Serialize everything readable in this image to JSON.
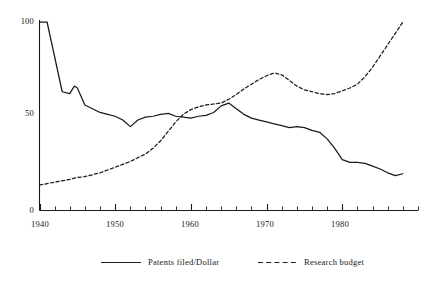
{
  "chart_data": {
    "type": "line",
    "title": "",
    "subtitle": "",
    "xlabel": "",
    "ylabel": "",
    "xlim": [
      1940,
      1990
    ],
    "ylim": [
      0,
      105
    ],
    "grid": false,
    "legend_position": "bottom",
    "y_ticks": [
      "0",
      "50",
      "100"
    ],
    "y_tick_values": [
      0,
      50,
      100
    ],
    "x_ticks": [
      "1940",
      "1950",
      "1960",
      "1970",
      "1980"
    ],
    "x_tick_values": [
      1940,
      1950,
      1960,
      1970,
      1980
    ],
    "x_minor_tick_step": 2,
    "series": [
      {
        "name": "Patents filed/Dollar",
        "style": "solid",
        "color": "#1a1a1a",
        "x": [
          1940,
          1941,
          1943,
          1944,
          1944.6,
          1945,
          1946,
          1947,
          1948,
          1949,
          1950,
          1951,
          1952,
          1953,
          1954,
          1955,
          1956,
          1957,
          1958,
          1959,
          1960,
          1961,
          1962,
          1963,
          1964,
          1965,
          1966,
          1967,
          1968,
          1969,
          1970,
          1971,
          1972,
          1973,
          1974,
          1975,
          1976,
          1977,
          1978,
          1979,
          1980,
          1981,
          1982,
          1983,
          1984,
          1985,
          1986,
          1987,
          1988
        ],
        "values": [
          100,
          100,
          63,
          62,
          66,
          65,
          56,
          54,
          52,
          51,
          50,
          48,
          44.5,
          48,
          49.5,
          50,
          51,
          51.5,
          50,
          49.5,
          49,
          50,
          50.5,
          52,
          55.5,
          57,
          54,
          51,
          49,
          48,
          47,
          46,
          45,
          44,
          44.5,
          44,
          42.5,
          41.5,
          38,
          33,
          27,
          25.5,
          25.5,
          25,
          23.5,
          22,
          20,
          18.5,
          19.5
        ]
      },
      {
        "name": "Research budget",
        "style": "dashed",
        "color": "#1a1a1a",
        "x": [
          1940,
          1942,
          1944,
          1945,
          1946,
          1947,
          1948,
          1949,
          1950,
          1951,
          1952,
          1953,
          1954,
          1955,
          1956,
          1957,
          1958,
          1959,
          1960,
          1961,
          1962,
          1963,
          1964,
          1965,
          1966,
          1967,
          1968,
          1969,
          1970,
          1971,
          1972,
          1973,
          1974,
          1975,
          1976,
          1977,
          1978,
          1979,
          1980,
          1981,
          1982,
          1983,
          1984,
          1985,
          1986,
          1987,
          1988
        ],
        "values": [
          13.5,
          15,
          16.5,
          17.5,
          18,
          19,
          20,
          21.5,
          23,
          24.5,
          26,
          28,
          30,
          33,
          37,
          42,
          47,
          51,
          53.5,
          55,
          56,
          56.5,
          57,
          59,
          61.5,
          64.5,
          67,
          69.5,
          71.5,
          73,
          72,
          69,
          66,
          64,
          63,
          62,
          61.5,
          62,
          63.5,
          65,
          67,
          71,
          76,
          82,
          88,
          94,
          100
        ]
      }
    ],
    "annotations": []
  },
  "legend": {
    "items": [
      {
        "label": "Patents filed/Dollar",
        "style": "solid"
      },
      {
        "label": "Research budget",
        "style": "dashed"
      }
    ]
  },
  "axes": {
    "y_label_100": "100",
    "y_label_50": "50",
    "y_label_0": "0",
    "x_label_1940": "1940",
    "x_label_1950": "1950",
    "x_label_1960": "1960",
    "x_label_1970": "1970",
    "x_label_1980": "1980"
  }
}
